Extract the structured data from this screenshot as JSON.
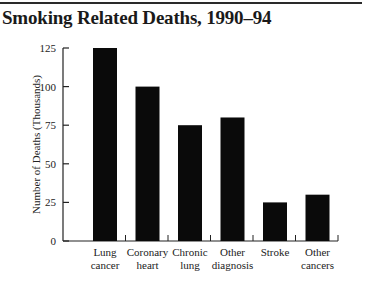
{
  "title": "Smoking Related Deaths, 1990–94",
  "chart_data": {
    "type": "bar",
    "title": "Smoking Related Deaths, 1990–94",
    "categories": [
      [
        "Lung",
        "cancer"
      ],
      [
        "Coronary",
        "heart"
      ],
      [
        "Chronic",
        "lung"
      ],
      [
        "Other",
        "diagnosis"
      ],
      [
        "Stroke"
      ],
      [
        "Other",
        "cancers"
      ]
    ],
    "category_names": [
      "Lung cancer",
      "Coronary heart",
      "Chronic lung",
      "Other diagnosis",
      "Stroke",
      "Other cancers"
    ],
    "values": [
      125,
      100,
      75,
      80,
      25,
      30
    ],
    "xlabel": "",
    "ylabel": "Number of Deaths (Thousands)",
    "ylim": [
      0,
      125
    ],
    "yticks": [
      0,
      25,
      50,
      75,
      100,
      125
    ],
    "grid": false,
    "legend": null,
    "bar_color": "#0a0a0a"
  }
}
